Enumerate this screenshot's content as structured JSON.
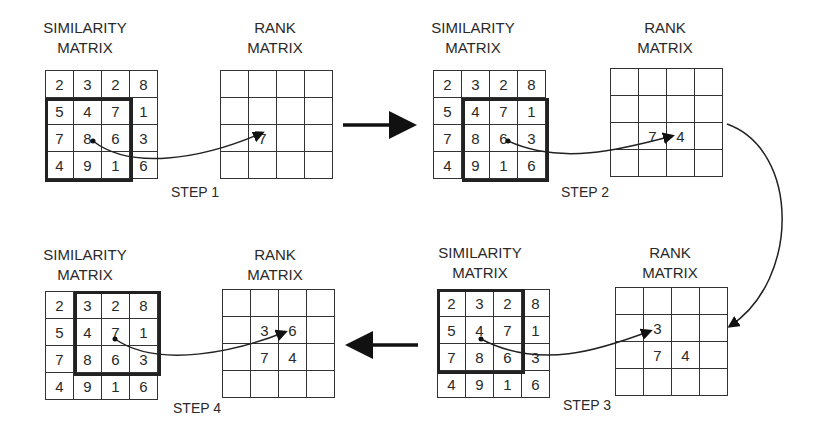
{
  "labels": {
    "similarity_1": "SIMILARITY",
    "similarity_2": "MATRIX",
    "rank_1": "RANK",
    "rank_2": "MATRIX"
  },
  "steps": [
    {
      "title": "STEP 1",
      "similarity": [
        [
          "2",
          "3",
          "2",
          "8"
        ],
        [
          "5",
          "4",
          "7",
          "1"
        ],
        [
          "7",
          "8",
          "6",
          "3"
        ],
        [
          "4",
          "9",
          "1",
          "6"
        ]
      ],
      "window": {
        "row": 1,
        "col": 0
      },
      "rank": [
        [
          "",
          "",
          "",
          ""
        ],
        [
          "",
          "",
          "",
          ""
        ],
        [
          "",
          "7",
          "",
          ""
        ],
        [
          "",
          "",
          "",
          ""
        ]
      ]
    },
    {
      "title": "STEP 2",
      "similarity": [
        [
          "2",
          "3",
          "2",
          "8"
        ],
        [
          "5",
          "4",
          "7",
          "1"
        ],
        [
          "7",
          "8",
          "6",
          "3"
        ],
        [
          "4",
          "9",
          "1",
          "6"
        ]
      ],
      "window": {
        "row": 1,
        "col": 1
      },
      "rank": [
        [
          "",
          "",
          "",
          ""
        ],
        [
          "",
          "",
          "",
          ""
        ],
        [
          "",
          "7",
          "4",
          ""
        ],
        [
          "",
          "",
          "",
          ""
        ]
      ]
    },
    {
      "title": "STEP 3",
      "similarity": [
        [
          "2",
          "3",
          "2",
          "8"
        ],
        [
          "5",
          "4",
          "7",
          "1"
        ],
        [
          "7",
          "8",
          "6",
          "3"
        ],
        [
          "4",
          "9",
          "1",
          "6"
        ]
      ],
      "window": {
        "row": 0,
        "col": 0
      },
      "rank": [
        [
          "",
          "",
          "",
          ""
        ],
        [
          "",
          "3",
          "",
          ""
        ],
        [
          "",
          "7",
          "4",
          ""
        ],
        [
          "",
          "",
          "",
          ""
        ]
      ]
    },
    {
      "title": "STEP 4",
      "similarity": [
        [
          "2",
          "3",
          "2",
          "8"
        ],
        [
          "5",
          "4",
          "7",
          "1"
        ],
        [
          "7",
          "8",
          "6",
          "3"
        ],
        [
          "4",
          "9",
          "1",
          "6"
        ]
      ],
      "window": {
        "row": 0,
        "col": 1
      },
      "rank": [
        [
          "",
          "",
          "",
          ""
        ],
        [
          "",
          "3",
          "6",
          ""
        ],
        [
          "",
          "7",
          "4",
          ""
        ],
        [
          "",
          "",
          "",
          ""
        ]
      ]
    }
  ]
}
